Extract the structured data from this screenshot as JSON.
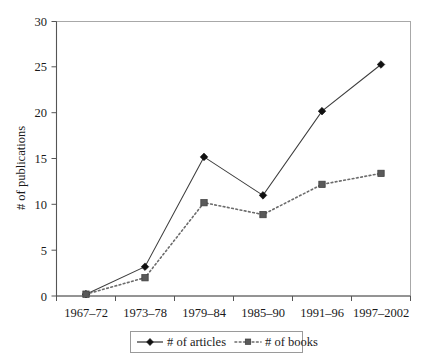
{
  "chart_data": {
    "type": "line",
    "title": "",
    "xlabel": "",
    "ylabel": "# of publications",
    "categories": [
      "1967–72",
      "1973–78",
      "1979–84",
      "1985–90",
      "1991–96",
      "1997–2002"
    ],
    "series": [
      {
        "name": "# of articles",
        "values": [
          0.2,
          3.2,
          15.2,
          11.0,
          20.2,
          25.3
        ],
        "marker": "diamond",
        "linestyle": "solid",
        "color": "#111111"
      },
      {
        "name": "# of books",
        "values": [
          0.2,
          2.0,
          10.2,
          8.9,
          12.2,
          13.4
        ],
        "marker": "square",
        "linestyle": "dotted",
        "color": "#5a5a5a"
      }
    ],
    "ylim": [
      0,
      30
    ],
    "ytick_labels": [
      "0",
      "5",
      "10",
      "15",
      "20",
      "25",
      "30"
    ],
    "ytick_values": [
      0,
      5,
      10,
      15,
      20,
      25,
      30
    ],
    "grid": false,
    "legend_position": "bottom"
  },
  "axes": {
    "y_title": "# of publications",
    "y_ticks": [
      "30",
      "25",
      "20",
      "15",
      "10",
      "5",
      "0"
    ],
    "x_ticks": [
      "1967–72",
      "1973–78",
      "1979–84",
      "1985–90",
      "1991–96",
      "1997–2002"
    ]
  },
  "legend": {
    "entries": [
      {
        "label": "# of articles",
        "marker_icon": "diamond-marker-icon",
        "line_icon": "solid-line-icon"
      },
      {
        "label": "# of books",
        "marker_icon": "square-marker-icon",
        "line_icon": "dotted-line-icon"
      }
    ]
  },
  "colors": {
    "articles": "#111111",
    "books": "#5a5a5a",
    "frame": "#a8a8a8",
    "axis": "#555555",
    "background": "#ffffff"
  }
}
